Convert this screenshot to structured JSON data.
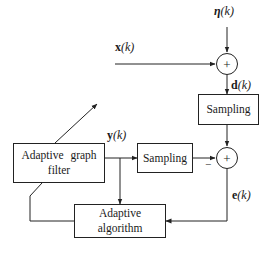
{
  "diagram": {
    "type": "block-diagram",
    "title": "",
    "blocks": {
      "adaptive_filter": {
        "line1": "Adaptive graph",
        "line2": "filter"
      },
      "sampling_top": {
        "label": "Sampling"
      },
      "sampling_mid": {
        "label": "Sampling"
      },
      "adaptive_algorithm": {
        "line1": "Adaptive",
        "line2": "algorithm"
      }
    },
    "sum_nodes": {
      "top": {
        "symbol": "+"
      },
      "bottom": {
        "symbol": "+",
        "minus_sign": "−"
      }
    },
    "signals": {
      "eta": {
        "name": "η",
        "arg": "(k)"
      },
      "x": {
        "name": "x",
        "arg": "(k)"
      },
      "d": {
        "name": "d",
        "arg": "(k)"
      },
      "y": {
        "name": "y",
        "arg": "(k)"
      },
      "e": {
        "name": "e",
        "arg": "(k)"
      }
    },
    "edges": [
      {
        "from": "eta",
        "to": "sum_top"
      },
      {
        "from": "x",
        "to": "sum_top"
      },
      {
        "from": "sum_top",
        "to": "sampling_top",
        "label": "d(k)"
      },
      {
        "from": "sampling_top",
        "to": "sum_bottom"
      },
      {
        "from": "adaptive_filter",
        "to": "sampling_mid",
        "label": "y(k)"
      },
      {
        "from": "sampling_mid",
        "to": "sum_bottom",
        "sign": "-"
      },
      {
        "from": "adaptive_filter_output",
        "to": "adaptive_algorithm"
      },
      {
        "from": "sum_bottom",
        "to": "adaptive_algorithm",
        "label": "e(k)"
      },
      {
        "from": "adaptive_algorithm",
        "to": "adaptive_filter",
        "type": "adaptation-arrow"
      }
    ]
  }
}
